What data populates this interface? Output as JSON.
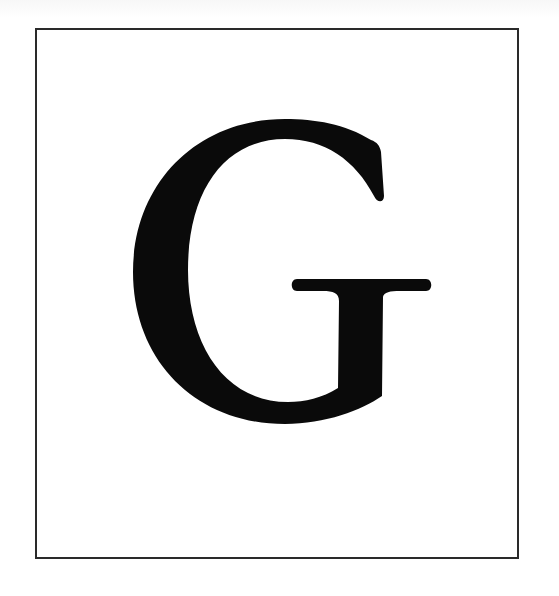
{
  "figure": {
    "letter": "G",
    "colors": {
      "background": "#ffffff",
      "frame": "#2a2a2a",
      "letter": "#0a0a0a"
    }
  }
}
